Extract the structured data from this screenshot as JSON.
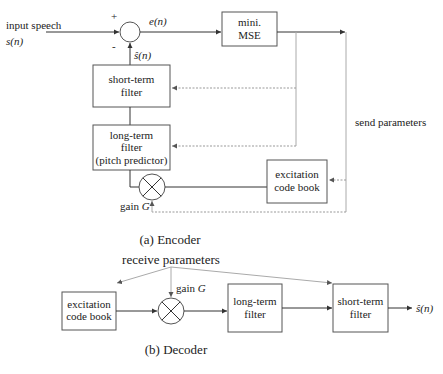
{
  "encoder": {
    "caption": "(a) Encoder",
    "input_label": "input speech",
    "input_signal": "s(n)",
    "plus_sign": "+",
    "minus_sign": "-",
    "error_signal": "e(n)",
    "predicted_signal": "ŝ(n)",
    "mse_box": {
      "line1": "mini.",
      "line2": "MSE"
    },
    "short_term_filter": {
      "line1": "short-term",
      "line2": "filter"
    },
    "long_term_filter": {
      "line1": "long-term",
      "line2": "filter",
      "line3": "(pitch predictor)"
    },
    "excitation_codebook": {
      "line1": "excitation",
      "line2": "code book"
    },
    "gain_label": "gain",
    "gain_symbol": "G",
    "send_parameters": "send parameters"
  },
  "decoder": {
    "caption": "(b) Decoder",
    "receive_parameters": "receive parameters",
    "excitation_codebook": {
      "line1": "excitation",
      "line2": "code book"
    },
    "gain_label": "gain",
    "gain_symbol": "G",
    "long_term_filter": {
      "line1": "long-term",
      "line2": "filter"
    },
    "short_term_filter": {
      "line1": "short-term",
      "line2": "filter"
    },
    "output_signal": "ŝ(n)"
  }
}
